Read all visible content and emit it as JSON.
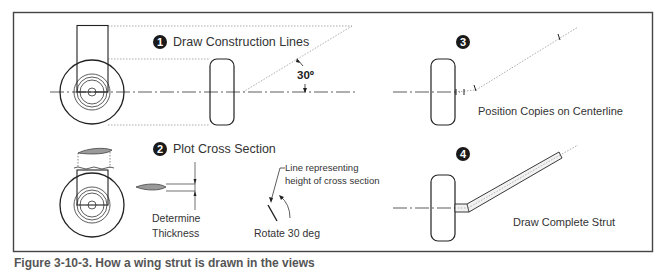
{
  "figure": {
    "caption": "Figure 3-10-3. How a wing strut is drawn in the views",
    "border_color": "#444444",
    "line_color": "#222222",
    "construction_line_color": "#888888",
    "airfoil_fill": "#9a9a9a"
  },
  "steps": [
    {
      "number": "1",
      "label": "Draw Construction Lines",
      "angle_label": "30º"
    },
    {
      "number": "2",
      "label": "Plot Cross Section",
      "annotations": {
        "thickness_line1": "Determine",
        "thickness_line2": "Thickness",
        "height_line1": "Line representing",
        "height_line2": "height of cross section",
        "rotate": "Rotate 30 deg"
      }
    },
    {
      "number": "3",
      "label": "Position Copies on Centerline"
    },
    {
      "number": "4",
      "label": "Draw Complete Strut"
    }
  ]
}
